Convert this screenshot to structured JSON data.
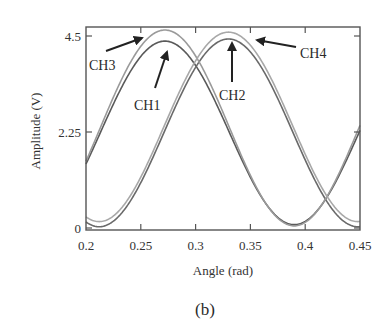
{
  "chart_data": {
    "type": "line",
    "title": "",
    "panel_label": "(b)",
    "xlabel": "Angle (rad)",
    "ylabel": "Amplitude (V)",
    "xlim": [
      0.2,
      0.45
    ],
    "ylim": [
      0,
      4.5
    ],
    "xticks": [
      0.2,
      0.25,
      0.3,
      0.35,
      0.4,
      0.45
    ],
    "xtick_labels": [
      "0.2",
      "0.25",
      "0.3",
      "0.35",
      "0.4",
      "0.45"
    ],
    "yticks": [
      0,
      2.25,
      4.5
    ],
    "ytick_labels": [
      "0",
      "2.25",
      "4.5"
    ],
    "grid": false,
    "legend": "annotations",
    "series": [
      {
        "name": "CH1",
        "peak_x": 0.272,
        "peak_y": 4.38,
        "min_y": 0.08,
        "period": 0.236,
        "color": "#5a5a5a",
        "x": [
          0.2,
          0.225,
          0.25,
          0.272,
          0.3,
          0.325,
          0.35,
          0.375,
          0.39,
          0.41,
          0.43,
          0.45
        ],
        "y": [
          1.55,
          2.85,
          3.95,
          4.38,
          3.85,
          2.75,
          1.5,
          0.45,
          0.08,
          0.25,
          1.05,
          2.1
        ]
      },
      {
        "name": "CH2",
        "peak_x": 0.33,
        "peak_y": 4.43,
        "min_y": 0.03,
        "period": 0.236,
        "color": "#6a6a6a",
        "x": [
          0.2,
          0.212,
          0.225,
          0.25,
          0.275,
          0.3,
          0.33,
          0.35,
          0.375,
          0.4,
          0.425,
          0.45
        ],
        "y": [
          0.1,
          0.03,
          0.15,
          0.95,
          2.25,
          3.55,
          4.43,
          4.15,
          3.2,
          1.95,
          0.8,
          0.12
        ]
      },
      {
        "name": "CH3",
        "peak_x": 0.272,
        "peak_y": 4.64,
        "min_y": 0.05,
        "period": 0.236,
        "color": "#9a9a9a",
        "x": [
          0.2,
          0.225,
          0.25,
          0.272,
          0.3,
          0.325,
          0.35,
          0.375,
          0.39,
          0.41,
          0.43,
          0.45
        ],
        "y": [
          1.6,
          2.95,
          4.15,
          4.64,
          4.05,
          2.85,
          1.55,
          0.42,
          0.05,
          0.22,
          1.05,
          2.15
        ]
      },
      {
        "name": "CH4",
        "peak_x": 0.33,
        "peak_y": 4.59,
        "min_y": 0.15,
        "period": 0.236,
        "color": "#a8a8a8",
        "x": [
          0.2,
          0.212,
          0.225,
          0.25,
          0.275,
          0.3,
          0.33,
          0.35,
          0.375,
          0.4,
          0.425,
          0.45
        ],
        "y": [
          0.3,
          0.15,
          0.3,
          1.05,
          2.35,
          3.7,
          4.59,
          4.3,
          3.3,
          2.0,
          0.9,
          0.25
        ]
      }
    ],
    "annotations": [
      {
        "text": "CH3",
        "text_x": 89,
        "text_y": 70,
        "arrow": [
          106,
          51,
          142,
          38
        ]
      },
      {
        "text": "CH1",
        "text_x": 134,
        "text_y": 110,
        "arrow": [
          155,
          88,
          167,
          52
        ]
      },
      {
        "text": "CH2",
        "text_x": 219,
        "text_y": 100,
        "arrow": [
          232,
          82,
          232,
          43
        ]
      },
      {
        "text": "CH4",
        "text_x": 300,
        "text_y": 58,
        "arrow": [
          296,
          47,
          257,
          40
        ]
      }
    ]
  }
}
